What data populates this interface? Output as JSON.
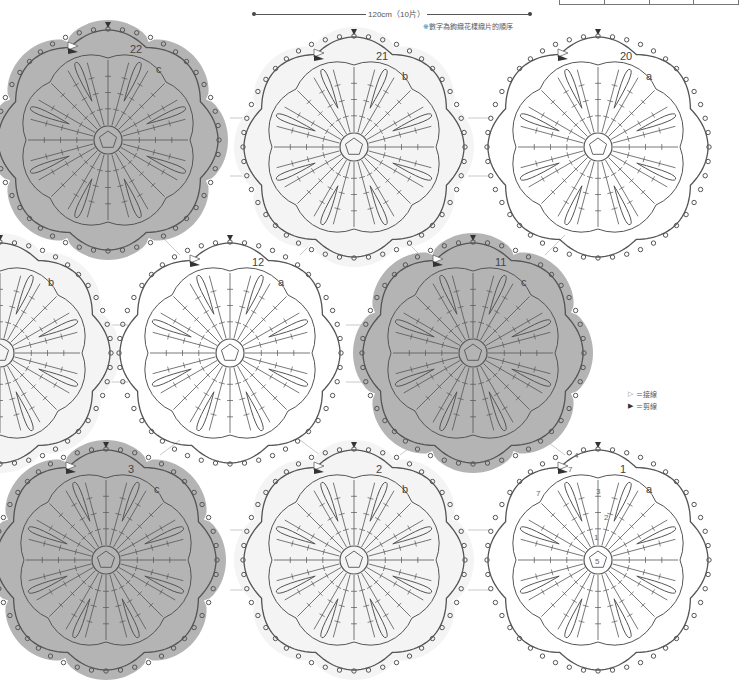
{
  "header": {
    "dimension_label": "120cm（10片）",
    "note": "※數字為鉤織花樣織片的順序",
    "top_table_cells": [
      "",
      "",
      "",
      ""
    ]
  },
  "legend": {
    "items": [
      {
        "symbol": "▷",
        "label": "＝接線",
        "icon": "open-triangle-icon"
      },
      {
        "symbol": "▶",
        "label": "＝剪線",
        "icon": "filled-triangle-icon"
      }
    ]
  },
  "colors": {
    "a_fill": "#ffffff",
    "b_fill": "#f4f4f4",
    "c_fill": "#b4b4b4",
    "stroke": "#555555"
  },
  "motifs": [
    {
      "number": "22",
      "color_code": "c",
      "cx": 108,
      "cy": 140,
      "partial": true
    },
    {
      "number": "21",
      "color_code": "b",
      "cx": 354,
      "cy": 147
    },
    {
      "number": "20",
      "color_code": "a",
      "cx": 598,
      "cy": 147
    },
    {
      "number": "",
      "color_code": "b",
      "cx": 0,
      "cy": 353,
      "partial": true
    },
    {
      "number": "12",
      "color_code": "a",
      "cx": 230,
      "cy": 353
    },
    {
      "number": "11",
      "color_code": "c",
      "cx": 473,
      "cy": 353
    },
    {
      "number": "3",
      "color_code": "c",
      "cx": 106,
      "cy": 560,
      "partial": true
    },
    {
      "number": "2",
      "color_code": "b",
      "cx": 354,
      "cy": 560
    },
    {
      "number": "1",
      "color_code": "a",
      "cx": 598,
      "cy": 560
    }
  ],
  "motif1_round_labels": {
    "r1": "1",
    "r2": "2",
    "r3": "3",
    "r4": "4",
    "r5": "5",
    "r7a": "7",
    "r7b": "7"
  }
}
